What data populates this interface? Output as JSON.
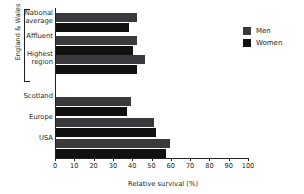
{
  "chart_data": {
    "type": "bar",
    "orientation": "horizontal",
    "title": "",
    "xlabel": "Relative survival (%)",
    "ylabel": "",
    "xlim": [
      0,
      100
    ],
    "xticks": [
      0,
      10,
      20,
      30,
      40,
      50,
      60,
      70,
      80,
      90,
      100
    ],
    "grid": false,
    "legend_position": "top-right",
    "categories": [
      "National average",
      "Affluent",
      "Highest region",
      "Scotland",
      "Europe",
      "USA"
    ],
    "series": [
      {
        "name": "Men",
        "color": "#3a3a3c",
        "values": [
          42,
          42,
          46,
          39,
          51,
          59
        ]
      },
      {
        "name": "Women",
        "color": "#111111",
        "values": [
          38,
          40,
          42,
          37,
          52,
          57
        ]
      }
    ],
    "groups": [
      {
        "label": "England & Wales",
        "categories": [
          "National average",
          "Affluent",
          "Highest region"
        ]
      }
    ]
  },
  "axis": {
    "tick_labels": [
      "0",
      "10",
      "20",
      "30",
      "40",
      "50",
      "60",
      "70",
      "80",
      "90",
      "100"
    ],
    "x_axis_title": "Relative survival (%)"
  },
  "category_labels": [
    {
      "line1": "National",
      "line2": "average"
    },
    {
      "line1": "Affluent",
      "line2": ""
    },
    {
      "line1": "Highest",
      "line2": "region"
    },
    {
      "line1": "Scotland",
      "line2": ""
    },
    {
      "line1": "Europe",
      "line2": ""
    },
    {
      "line1": "USA",
      "line2": ""
    }
  ],
  "group": {
    "label": "England & Wales"
  },
  "legend": {
    "items": [
      {
        "label": "Men"
      },
      {
        "label": "Women"
      }
    ]
  }
}
